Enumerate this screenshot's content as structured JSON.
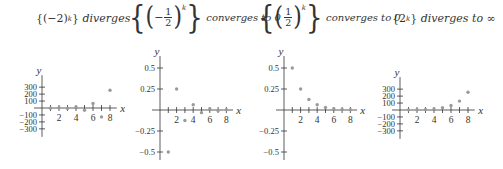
{
  "panels": [
    {
      "title": {
        "expr_base": "(−2)",
        "expr_exp": "k",
        "desc": "diverges"
      },
      "axis": {
        "x_label": "x",
        "y_label": "y"
      },
      "x_ticks": [
        "2",
        "4",
        "6",
        "8"
      ],
      "y_ticks": [
        "300",
        "200",
        "100",
        "−100",
        "−200",
        "−300"
      ]
    },
    {
      "title": {
        "expr_sign": "−",
        "num": "1",
        "den": "2",
        "expr_exp": "k",
        "desc": "converges to 0"
      },
      "axis": {
        "x_label": "x",
        "y_label": "y"
      },
      "x_ticks": [
        "2",
        "4",
        "6",
        "8"
      ],
      "y_ticks": [
        "0.5",
        "0.25",
        "−0.25",
        "−0.5"
      ]
    },
    {
      "title": {
        "num": "1",
        "den": "2",
        "expr_exp": "k",
        "desc": "converges to 0"
      },
      "axis": {
        "x_label": "x",
        "y_label": "y"
      },
      "x_ticks": [
        "2",
        "4",
        "6",
        "8"
      ],
      "y_ticks": [
        "0.5",
        "0.25",
        "−0.25",
        "−0.5"
      ]
    },
    {
      "title": {
        "expr_base": "2",
        "expr_exp": "k",
        "desc": "diverges to ∞"
      },
      "axis": {
        "x_label": "x",
        "y_label": "y"
      },
      "x_ticks": [
        "2",
        "4",
        "6",
        "8"
      ],
      "y_ticks": [
        "300",
        "200",
        "100",
        "−100",
        "−200",
        "−300"
      ]
    }
  ],
  "chart_data": [
    {
      "type": "scatter",
      "title": "{(−2)^k} diverges",
      "xlabel": "x",
      "ylabel": "y",
      "x": [
        1,
        2,
        3,
        4,
        5,
        6,
        7,
        8
      ],
      "values": [
        -2,
        4,
        -8,
        16,
        -32,
        64,
        -128,
        256
      ],
      "ylim": [
        -300,
        300
      ],
      "xlim": [
        0,
        8.5
      ],
      "grid": false
    },
    {
      "type": "scatter",
      "title": "{(−1/2)^k} converges to 0",
      "xlabel": "x",
      "ylabel": "y",
      "x": [
        1,
        2,
        3,
        4,
        5,
        6,
        7,
        8
      ],
      "values": [
        -0.5,
        0.25,
        -0.125,
        0.0625,
        -0.03125,
        0.015625,
        -0.0078125,
        0.00390625
      ],
      "ylim": [
        -0.5,
        0.5
      ],
      "xlim": [
        0,
        8.5
      ],
      "grid": false
    },
    {
      "type": "scatter",
      "title": "{(1/2)^k} converges to 0",
      "xlabel": "x",
      "ylabel": "y",
      "x": [
        1,
        2,
        3,
        4,
        5,
        6,
        7,
        8
      ],
      "values": [
        0.5,
        0.25,
        0.125,
        0.0625,
        0.03125,
        0.015625,
        0.0078125,
        0.00390625
      ],
      "ylim": [
        -0.5,
        0.5
      ],
      "xlim": [
        0,
        8.5
      ],
      "grid": false
    },
    {
      "type": "scatter",
      "title": "{2^k} diverges to ∞",
      "xlabel": "x",
      "ylabel": "y",
      "x": [
        1,
        2,
        3,
        4,
        5,
        6,
        7,
        8
      ],
      "values": [
        2,
        4,
        8,
        16,
        32,
        64,
        128,
        256
      ],
      "ylim": [
        -300,
        300
      ],
      "xlim": [
        0,
        8.5
      ],
      "grid": false
    }
  ],
  "colors": {
    "axis": "#333333",
    "point": "#9a9a9a",
    "text": "#333333"
  }
}
